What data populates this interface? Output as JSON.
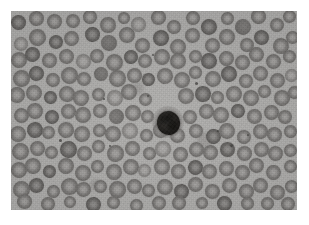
{
  "canvas": {
    "width": 309,
    "height": 225,
    "background": "#ffffff"
  },
  "image": {
    "kind": "micrograph",
    "subject": "peripheral-blood-smear",
    "modality": "light-microscopy",
    "color_mode": "grayscale",
    "caption": "",
    "frame": {
      "x": 11,
      "y": 11,
      "width": 286,
      "height": 199
    },
    "palette": {
      "plasma_background": "#b4b3b1",
      "erythrocyte_rim": "#74726f",
      "erythrocyte_pallor": "#a9a7a5",
      "leukocyte_nucleus": "#1b1917",
      "platelet_speck": "#464442"
    },
    "counts": {
      "erythrocytes": 131,
      "leukocytes": 1,
      "platelets": 9
    },
    "leukocyte": {
      "cx": 168,
      "cy": 122,
      "diameter": 23,
      "label": "nucleated-dark-cell"
    },
    "erythrocytes": [
      [
        20,
        24,
        15,
        "d"
      ],
      [
        37,
        18,
        13,
        "n"
      ],
      [
        54,
        22,
        14,
        "n"
      ],
      [
        20,
        43,
        14,
        "p"
      ],
      [
        38,
        38,
        15,
        "n"
      ],
      [
        56,
        41,
        13,
        "d"
      ],
      [
        72,
        21,
        14,
        "n"
      ],
      [
        73,
        40,
        13,
        "n"
      ],
      [
        90,
        17,
        13,
        "n"
      ],
      [
        92,
        35,
        15,
        "d"
      ],
      [
        107,
        24,
        14,
        "n"
      ],
      [
        110,
        43,
        15,
        "s"
      ],
      [
        124,
        17,
        12,
        "n"
      ],
      [
        126,
        35,
        14,
        "n"
      ],
      [
        140,
        26,
        14,
        "p"
      ],
      [
        143,
        45,
        15,
        "n"
      ],
      [
        158,
        18,
        13,
        "n"
      ],
      [
        160,
        37,
        15,
        "d"
      ],
      [
        175,
        27,
        14,
        "n"
      ],
      [
        178,
        46,
        14,
        "n"
      ],
      [
        192,
        18,
        13,
        "n"
      ],
      [
        194,
        37,
        15,
        "n"
      ],
      [
        209,
        27,
        14,
        "d"
      ],
      [
        212,
        46,
        14,
        "n"
      ],
      [
        226,
        18,
        13,
        "n"
      ],
      [
        228,
        37,
        14,
        "n"
      ],
      [
        243,
        26,
        15,
        "s"
      ],
      [
        246,
        45,
        14,
        "n"
      ],
      [
        260,
        18,
        13,
        "n"
      ],
      [
        262,
        37,
        14,
        "d"
      ],
      [
        277,
        26,
        14,
        "n"
      ],
      [
        280,
        45,
        14,
        "n"
      ],
      [
        290,
        17,
        12,
        "n"
      ],
      [
        292,
        36,
        13,
        "n"
      ],
      [
        18,
        60,
        14,
        "n"
      ],
      [
        34,
        56,
        14,
        "d"
      ],
      [
        50,
        60,
        15,
        "n"
      ],
      [
        66,
        57,
        13,
        "n"
      ],
      [
        82,
        61,
        14,
        "p"
      ],
      [
        98,
        56,
        14,
        "n"
      ],
      [
        114,
        61,
        15,
        "n"
      ],
      [
        130,
        57,
        13,
        "d"
      ],
      [
        146,
        62,
        14,
        "n"
      ],
      [
        162,
        57,
        14,
        "n"
      ],
      [
        178,
        62,
        15,
        "n"
      ],
      [
        194,
        56,
        13,
        "n"
      ],
      [
        210,
        61,
        14,
        "d"
      ],
      [
        226,
        57,
        14,
        "n"
      ],
      [
        242,
        62,
        15,
        "n"
      ],
      [
        258,
        56,
        13,
        "n"
      ],
      [
        274,
        61,
        14,
        "n"
      ],
      [
        289,
        57,
        13,
        "n"
      ],
      [
        20,
        78,
        15,
        "n"
      ],
      [
        37,
        74,
        14,
        "d"
      ],
      [
        53,
        79,
        14,
        "n"
      ],
      [
        69,
        75,
        15,
        "n"
      ],
      [
        85,
        80,
        13,
        "n"
      ],
      [
        101,
        74,
        14,
        "s"
      ],
      [
        117,
        79,
        15,
        "n"
      ],
      [
        133,
        75,
        14,
        "n"
      ],
      [
        149,
        80,
        13,
        "d"
      ],
      [
        165,
        75,
        14,
        "n"
      ],
      [
        181,
        80,
        15,
        "n"
      ],
      [
        197,
        74,
        13,
        "n"
      ],
      [
        213,
        79,
        14,
        "n"
      ],
      [
        229,
        75,
        15,
        "d"
      ],
      [
        245,
        80,
        14,
        "n"
      ],
      [
        261,
        74,
        13,
        "n"
      ],
      [
        277,
        79,
        14,
        "n"
      ],
      [
        291,
        75,
        13,
        "p"
      ],
      [
        18,
        96,
        14,
        "n"
      ],
      [
        34,
        93,
        15,
        "n"
      ],
      [
        50,
        98,
        13,
        "d"
      ],
      [
        66,
        93,
        14,
        "n"
      ],
      [
        82,
        98,
        15,
        "n"
      ],
      [
        98,
        93,
        13,
        "n"
      ],
      [
        114,
        98,
        14,
        "p"
      ],
      [
        130,
        93,
        15,
        "n"
      ],
      [
        146,
        99,
        13,
        "n"
      ],
      [
        186,
        97,
        14,
        "n"
      ],
      [
        202,
        93,
        15,
        "d"
      ],
      [
        218,
        98,
        13,
        "n"
      ],
      [
        234,
        93,
        14,
        "n"
      ],
      [
        250,
        98,
        15,
        "n"
      ],
      [
        266,
        93,
        13,
        "n"
      ],
      [
        282,
        98,
        14,
        "n"
      ],
      [
        294,
        93,
        12,
        "n"
      ],
      [
        20,
        115,
        15,
        "n"
      ],
      [
        36,
        111,
        14,
        "n"
      ],
      [
        52,
        116,
        13,
        "d"
      ],
      [
        68,
        111,
        15,
        "n"
      ],
      [
        84,
        116,
        14,
        "n"
      ],
      [
        100,
        111,
        13,
        "n"
      ],
      [
        116,
        117,
        15,
        "s"
      ],
      [
        132,
        112,
        14,
        "n"
      ],
      [
        148,
        117,
        12,
        "n"
      ],
      [
        190,
        116,
        14,
        "n"
      ],
      [
        206,
        111,
        13,
        "n"
      ],
      [
        222,
        116,
        15,
        "n"
      ],
      [
        238,
        111,
        14,
        "d"
      ],
      [
        254,
        117,
        13,
        "n"
      ],
      [
        270,
        112,
        14,
        "n"
      ],
      [
        286,
        117,
        14,
        "n"
      ],
      [
        18,
        133,
        14,
        "n"
      ],
      [
        34,
        130,
        15,
        "d"
      ],
      [
        50,
        134,
        13,
        "n"
      ],
      [
        66,
        130,
        14,
        "n"
      ],
      [
        82,
        135,
        15,
        "n"
      ],
      [
        98,
        130,
        13,
        "n"
      ],
      [
        114,
        134,
        14,
        "n"
      ],
      [
        130,
        130,
        15,
        "p"
      ],
      [
        146,
        135,
        13,
        "n"
      ],
      [
        162,
        131,
        14,
        "n"
      ],
      [
        178,
        135,
        14,
        "n"
      ],
      [
        196,
        132,
        14,
        "n"
      ],
      [
        212,
        136,
        13,
        "d"
      ],
      [
        228,
        131,
        15,
        "n"
      ],
      [
        244,
        136,
        14,
        "n"
      ],
      [
        260,
        131,
        13,
        "n"
      ],
      [
        276,
        136,
        14,
        "n"
      ],
      [
        291,
        131,
        13,
        "n"
      ],
      [
        20,
        152,
        15,
        "n"
      ],
      [
        36,
        148,
        14,
        "n"
      ],
      [
        52,
        153,
        13,
        "n"
      ],
      [
        68,
        148,
        15,
        "d"
      ],
      [
        84,
        153,
        14,
        "n"
      ],
      [
        100,
        148,
        13,
        "n"
      ],
      [
        116,
        153,
        15,
        "n"
      ],
      [
        132,
        149,
        14,
        "n"
      ],
      [
        148,
        153,
        13,
        "n"
      ],
      [
        164,
        149,
        14,
        "p"
      ],
      [
        180,
        153,
        14,
        "n"
      ],
      [
        196,
        149,
        15,
        "n"
      ],
      [
        212,
        154,
        13,
        "n"
      ],
      [
        228,
        149,
        14,
        "d"
      ],
      [
        244,
        154,
        15,
        "n"
      ],
      [
        260,
        149,
        13,
        "n"
      ],
      [
        276,
        154,
        14,
        "n"
      ],
      [
        290,
        149,
        13,
        "n"
      ],
      [
        18,
        170,
        14,
        "n"
      ],
      [
        34,
        167,
        15,
        "n"
      ],
      [
        50,
        171,
        13,
        "d"
      ],
      [
        66,
        167,
        14,
        "n"
      ],
      [
        82,
        172,
        15,
        "n"
      ],
      [
        98,
        167,
        13,
        "n"
      ],
      [
        114,
        171,
        14,
        "n"
      ],
      [
        130,
        167,
        15,
        "n"
      ],
      [
        146,
        172,
        13,
        "p"
      ],
      [
        162,
        167,
        14,
        "n"
      ],
      [
        178,
        172,
        14,
        "n"
      ],
      [
        194,
        167,
        15,
        "d"
      ],
      [
        210,
        172,
        13,
        "n"
      ],
      [
        226,
        167,
        14,
        "n"
      ],
      [
        242,
        172,
        15,
        "n"
      ],
      [
        258,
        167,
        13,
        "n"
      ],
      [
        274,
        172,
        14,
        "n"
      ],
      [
        290,
        167,
        13,
        "n"
      ],
      [
        20,
        189,
        15,
        "n"
      ],
      [
        37,
        186,
        14,
        "d"
      ],
      [
        53,
        190,
        13,
        "n"
      ],
      [
        69,
        186,
        15,
        "n"
      ],
      [
        85,
        191,
        14,
        "n"
      ],
      [
        101,
        186,
        13,
        "n"
      ],
      [
        117,
        190,
        15,
        "n"
      ],
      [
        133,
        186,
        14,
        "n"
      ],
      [
        149,
        191,
        13,
        "n"
      ],
      [
        165,
        186,
        14,
        "n"
      ],
      [
        181,
        191,
        14,
        "d"
      ],
      [
        197,
        186,
        15,
        "n"
      ],
      [
        213,
        191,
        13,
        "n"
      ],
      [
        229,
        186,
        14,
        "n"
      ],
      [
        245,
        191,
        15,
        "n"
      ],
      [
        261,
        186,
        13,
        "n"
      ],
      [
        277,
        191,
        14,
        "n"
      ],
      [
        291,
        186,
        13,
        "n"
      ],
      [
        26,
        203,
        13,
        "n"
      ],
      [
        48,
        204,
        13,
        "n"
      ],
      [
        70,
        203,
        12,
        "n"
      ],
      [
        92,
        204,
        13,
        "d"
      ],
      [
        114,
        203,
        12,
        "n"
      ],
      [
        136,
        204,
        13,
        "n"
      ],
      [
        158,
        203,
        12,
        "n"
      ],
      [
        180,
        204,
        13,
        "n"
      ],
      [
        202,
        203,
        12,
        "n"
      ],
      [
        224,
        204,
        13,
        "d"
      ],
      [
        246,
        203,
        12,
        "n"
      ],
      [
        268,
        204,
        13,
        "n"
      ],
      [
        288,
        203,
        12,
        "n"
      ]
    ],
    "platelets": [
      [
        196,
        83,
        3
      ],
      [
        148,
        96,
        2
      ],
      [
        60,
        140,
        3
      ],
      [
        218,
        131,
        2
      ],
      [
        110,
        146,
        2
      ],
      [
        231,
        145,
        3
      ],
      [
        153,
        55,
        2
      ],
      [
        104,
        99,
        2
      ],
      [
        248,
        135,
        2
      ]
    ],
    "smudges": [
      [
        205,
        140,
        16
      ],
      [
        138,
        88,
        12
      ],
      [
        70,
        150,
        10
      ],
      [
        240,
        60,
        11
      ],
      [
        96,
        185,
        12
      ]
    ]
  }
}
